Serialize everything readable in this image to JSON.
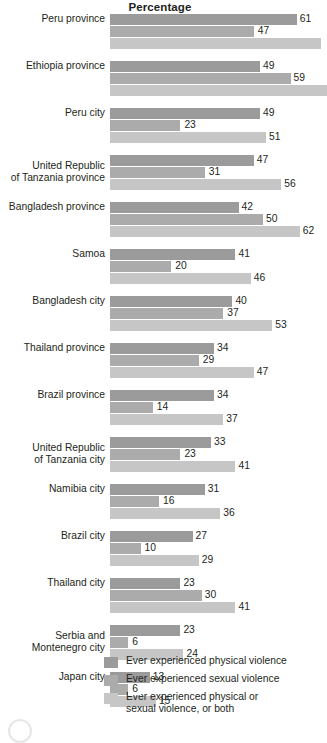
{
  "chart_data": {
    "type": "bar",
    "orientation": "horizontal",
    "title": "Percentage",
    "xlabel": "",
    "ylabel": "",
    "xlim": [
      0,
      68
    ],
    "grid": false,
    "legend_position": "bottom",
    "categories": [
      "Peru province",
      "Ethiopia province",
      "Peru city",
      "United Republic of Tanzania province",
      "Bangladesh province",
      "Samoa",
      "Bangladesh city",
      "Thailand province",
      "Brazil province",
      "United Republic of Tanzania city",
      "Namibia city",
      "Brazil city",
      "Thailand city",
      "Serbia and Montenegro city",
      "Japan city"
    ],
    "series": [
      {
        "name": "Ever experienced physical violence",
        "color": "#9b9b9b",
        "values": [
          61,
          49,
          49,
          47,
          42,
          41,
          40,
          34,
          34,
          33,
          31,
          27,
          23,
          23,
          13
        ]
      },
      {
        "name": "Ever experienced sexual violence",
        "color": "#ababab",
        "values": [
          47,
          59,
          23,
          31,
          50,
          20,
          37,
          29,
          14,
          23,
          16,
          10,
          30,
          6,
          6
        ]
      },
      {
        "name": "Ever experienced physical or sexual violence, or both",
        "color": "#c6c6c6",
        "values": [
          69,
          71,
          51,
          56,
          62,
          46,
          53,
          47,
          37,
          41,
          36,
          29,
          41,
          24,
          15
        ]
      }
    ]
  },
  "rows": [
    {
      "label_lines": [
        "Peru province"
      ],
      "bars": [
        {
          "value": 61,
          "label": "61",
          "label_style": "outside"
        },
        {
          "value": 47,
          "label": "47",
          "label_style": "boxed"
        },
        {
          "value": 69,
          "label": "",
          "label_style": "none"
        }
      ]
    },
    {
      "label_lines": [
        "Ethiopia province"
      ],
      "bars": [
        {
          "value": 49,
          "label": "49",
          "label_style": "outside"
        },
        {
          "value": 59,
          "label": "59",
          "label_style": "outside"
        },
        {
          "value": 71,
          "label": "",
          "label_style": "none"
        }
      ]
    },
    {
      "label_lines": [
        "Peru city"
      ],
      "bars": [
        {
          "value": 49,
          "label": "49",
          "label_style": "outside"
        },
        {
          "value": 23,
          "label": "23",
          "label_style": "boxed"
        },
        {
          "value": 51,
          "label": "51",
          "label_style": "outside"
        }
      ]
    },
    {
      "label_lines": [
        "United Republic",
        "of Tanzania province"
      ],
      "bars": [
        {
          "value": 47,
          "label": "47",
          "label_style": "outside"
        },
        {
          "value": 31,
          "label": "31",
          "label_style": "boxed"
        },
        {
          "value": 56,
          "label": "56",
          "label_style": "outside"
        }
      ]
    },
    {
      "label_lines": [
        "Bangladesh province"
      ],
      "bars": [
        {
          "value": 42,
          "label": "42",
          "label_style": "outside"
        },
        {
          "value": 50,
          "label": "50",
          "label_style": "outside"
        },
        {
          "value": 62,
          "label": "62",
          "label_style": "outside"
        }
      ]
    },
    {
      "label_lines": [
        "Samoa"
      ],
      "bars": [
        {
          "value": 41,
          "label": "41",
          "label_style": "outside"
        },
        {
          "value": 20,
          "label": "20",
          "label_style": "boxed"
        },
        {
          "value": 46,
          "label": "46",
          "label_style": "outside"
        }
      ]
    },
    {
      "label_lines": [
        "Bangladesh city"
      ],
      "bars": [
        {
          "value": 40,
          "label": "40",
          "label_style": "outside"
        },
        {
          "value": 37,
          "label": "37",
          "label_style": "boxed"
        },
        {
          "value": 53,
          "label": "53",
          "label_style": "outside"
        }
      ]
    },
    {
      "label_lines": [
        "Thailand province"
      ],
      "bars": [
        {
          "value": 34,
          "label": "34",
          "label_style": "outside"
        },
        {
          "value": 29,
          "label": "29",
          "label_style": "boxed"
        },
        {
          "value": 47,
          "label": "47",
          "label_style": "outside"
        }
      ]
    },
    {
      "label_lines": [
        "Brazil province"
      ],
      "bars": [
        {
          "value": 34,
          "label": "34",
          "label_style": "outside"
        },
        {
          "value": 14,
          "label": "14",
          "label_style": "boxed"
        },
        {
          "value": 37,
          "label": "37",
          "label_style": "outside"
        }
      ]
    },
    {
      "label_lines": [
        "United Republic",
        "of Tanzania city"
      ],
      "bars": [
        {
          "value": 33,
          "label": "33",
          "label_style": "outside"
        },
        {
          "value": 23,
          "label": "23",
          "label_style": "boxed"
        },
        {
          "value": 41,
          "label": "41",
          "label_style": "outside"
        }
      ]
    },
    {
      "label_lines": [
        "Namibia city"
      ],
      "bars": [
        {
          "value": 31,
          "label": "31",
          "label_style": "outside"
        },
        {
          "value": 16,
          "label": "16",
          "label_style": "boxed"
        },
        {
          "value": 36,
          "label": "36",
          "label_style": "outside"
        }
      ]
    },
    {
      "label_lines": [
        "Brazil city"
      ],
      "bars": [
        {
          "value": 27,
          "label": "27",
          "label_style": "outside"
        },
        {
          "value": 10,
          "label": "10",
          "label_style": "boxed"
        },
        {
          "value": 29,
          "label": "29",
          "label_style": "outside"
        }
      ]
    },
    {
      "label_lines": [
        "Thailand city"
      ],
      "bars": [
        {
          "value": 23,
          "label": "23",
          "label_style": "outside"
        },
        {
          "value": 30,
          "label": "30",
          "label_style": "outside"
        },
        {
          "value": 41,
          "label": "41",
          "label_style": "outside"
        }
      ]
    },
    {
      "label_lines": [
        "Serbia and",
        "Montenegro city"
      ],
      "bars": [
        {
          "value": 23,
          "label": "23",
          "label_style": "outside"
        },
        {
          "value": 6,
          "label": "6",
          "label_style": "boxed"
        },
        {
          "value": 24,
          "label": "24",
          "label_style": "outside"
        }
      ]
    },
    {
      "label_lines": [
        "Japan city"
      ],
      "bars": [
        {
          "value": 13,
          "label": "13",
          "label_style": "outside"
        },
        {
          "value": 6,
          "label": "6",
          "label_style": "boxed"
        },
        {
          "value": 15,
          "label": "15",
          "label_style": "outside"
        }
      ]
    }
  ],
  "legend": {
    "items": [
      {
        "color_class": "c1",
        "lines": [
          "Ever experienced physical violence"
        ]
      },
      {
        "color_class": "c2",
        "lines": [
          "Ever experienced sexual violence"
        ]
      },
      {
        "color_class": "c3",
        "lines": [
          "Ever experienced physical or",
          "sexual violence, or both"
        ]
      }
    ]
  },
  "scale": {
    "bar_origin_px": 110,
    "px_per_unit": 3.06
  }
}
